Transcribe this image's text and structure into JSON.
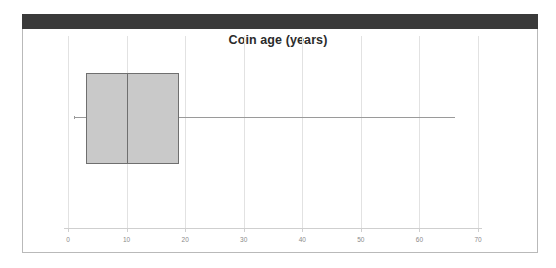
{
  "figure": {
    "title": "Coin age (years)",
    "banner_color": "#3a3a3a",
    "frame_color": "#b9b9b9",
    "background_color": "#ffffff"
  },
  "chart_data": {
    "type": "box",
    "title": "Coin age (years)",
    "xlabel": "",
    "ylabel": "",
    "orientation": "horizontal",
    "xlim": [
      0,
      70
    ],
    "grid": true,
    "legend": false,
    "xticks": [
      0,
      10,
      20,
      30,
      40,
      50,
      60,
      70
    ],
    "xtick_labels": [
      "0",
      "10",
      "20",
      "30",
      "40",
      "50",
      "60",
      "70"
    ],
    "categories": [
      "Coin age"
    ],
    "series": [
      {
        "name": "Coin age",
        "min": 1,
        "q1": 3,
        "median": 10,
        "q3": 19,
        "max": 66,
        "whisker_low": 1,
        "whisker_high": 66,
        "outliers": []
      }
    ],
    "box_fill_color": "#c9c9c9",
    "box_edge_color": "#6f6f6f",
    "whisker_color": "#9a9a9a",
    "gridline_color": "#e2e2e2",
    "tick_label_color": "#8a8a8a"
  }
}
